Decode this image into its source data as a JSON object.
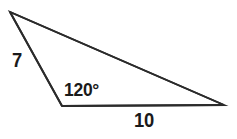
{
  "figure": {
    "name": "obtuse-triangle-diagram",
    "type": "geometry-figure",
    "background_color": "#ffffff",
    "stroke_color": "#2b2b2b",
    "text_color": "#1a1a1a"
  },
  "labels": {
    "side_left": "7",
    "angle_vertex": "120°",
    "side_base": "10"
  },
  "chart_data": {
    "type": "diagram",
    "subtype": "triangle",
    "title": "",
    "vertices": [
      {
        "id": "A",
        "x": 10,
        "y": 12,
        "role": "apex-top-left"
      },
      {
        "id": "B",
        "x": 62,
        "y": 106,
        "role": "obtuse-angle-vertex-bottom-left"
      },
      {
        "id": "C",
        "x": 224,
        "y": 105,
        "role": "acute-angle-vertex-bottom-right"
      }
    ],
    "edges": [
      {
        "from": "A",
        "to": "B",
        "label": "7",
        "name": "left-side"
      },
      {
        "from": "B",
        "to": "C",
        "label": "10",
        "name": "base-side"
      },
      {
        "from": "C",
        "to": "A",
        "label": "",
        "name": "long-hypotenuse-side"
      }
    ],
    "angles": [
      {
        "at": "B",
        "label": "120°",
        "value": 120,
        "unit": "degrees"
      }
    ],
    "given": [
      "side 7",
      "included angle 120°",
      "side 10"
    ],
    "grid": false,
    "legend": false
  }
}
